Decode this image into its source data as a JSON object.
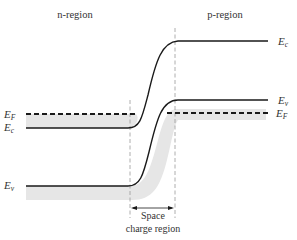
{
  "diagram": {
    "regions": {
      "left": "n-region",
      "right": "p-region"
    },
    "levels_left": [
      {
        "symbol": "E",
        "sub": "F",
        "name": "Fermi level (n-side)",
        "style": "dashed"
      },
      {
        "symbol": "E",
        "sub": "c",
        "name": "Conduction band edge (n-side)",
        "style": "solid"
      },
      {
        "symbol": "E",
        "sub": "v",
        "name": "Valence band edge (n-side)",
        "style": "solid"
      }
    ],
    "levels_right": [
      {
        "symbol": "E",
        "sub": "c",
        "name": "Conduction band edge (p-side)",
        "style": "solid"
      },
      {
        "symbol": "E",
        "sub": "v",
        "name": "Valence band edge (p-side)",
        "style": "solid"
      },
      {
        "symbol": "E",
        "sub": "F",
        "name": "Fermi level (p-side)",
        "style": "dashed"
      }
    ],
    "space_charge": {
      "line1": "Space",
      "line2": "charge region"
    },
    "colors": {
      "line": "#1a1a1a",
      "shade": "#e6e6e6",
      "boundary": "#999999",
      "text": "#333333"
    }
  }
}
